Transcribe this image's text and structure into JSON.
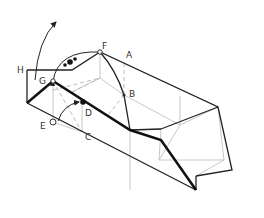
{
  "diagram": {
    "type": "geometric-figure",
    "labels": {
      "A": "A",
      "B": "B",
      "C": "C",
      "D": "D",
      "E": "E",
      "F": "F",
      "G": "G",
      "H": "H"
    },
    "colors": {
      "outline": "#222222",
      "bold_edge": "#111111",
      "hidden_edge": "#bbbbbb",
      "inner_edge": "#c8c8c8",
      "background": "#ffffff"
    }
  }
}
